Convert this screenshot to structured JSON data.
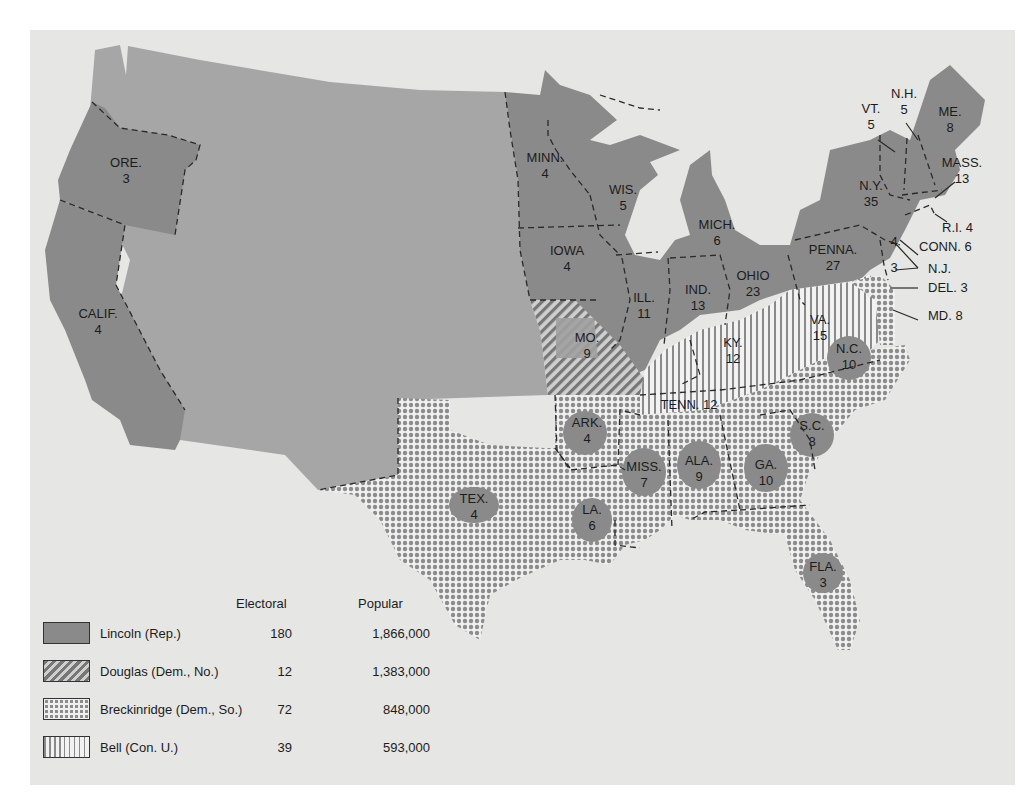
{
  "map": {
    "title": "Election of 1860",
    "background_color": "#e6e6e4",
    "colors": {
      "lincoln": "#8a8a8a",
      "territory": "#a6a6a6",
      "douglas_hatch": "#777777",
      "breckinridge_dot": "#8c8c8c",
      "bell_stripe": "#8a8a8a"
    },
    "states": [
      {
        "abbr": "ORE.",
        "electoral": "3",
        "party": "lincoln"
      },
      {
        "abbr": "CALIF.",
        "electoral": "4",
        "party": "lincoln"
      },
      {
        "abbr": "MINN.",
        "electoral": "4",
        "party": "lincoln"
      },
      {
        "abbr": "WIS.",
        "electoral": "5",
        "party": "lincoln"
      },
      {
        "abbr": "IOWA",
        "electoral": "4",
        "party": "lincoln"
      },
      {
        "abbr": "MICH.",
        "electoral": "6",
        "party": "lincoln"
      },
      {
        "abbr": "ILL.",
        "electoral": "11",
        "party": "lincoln"
      },
      {
        "abbr": "IND.",
        "electoral": "13",
        "party": "lincoln"
      },
      {
        "abbr": "OHIO",
        "electoral": "23",
        "party": "lincoln"
      },
      {
        "abbr": "PENNA.",
        "electoral": "27",
        "party": "lincoln"
      },
      {
        "abbr": "N.Y.",
        "electoral": "35",
        "party": "lincoln"
      },
      {
        "abbr": "VT.",
        "electoral": "5",
        "party": "lincoln"
      },
      {
        "abbr": "N.H.",
        "electoral": "5",
        "party": "lincoln"
      },
      {
        "abbr": "ME.",
        "electoral": "8",
        "party": "lincoln"
      },
      {
        "abbr": "MASS.",
        "electoral": "13",
        "party": "lincoln"
      },
      {
        "abbr": "R.I.",
        "electoral": "4",
        "party": "lincoln"
      },
      {
        "abbr": "CONN.",
        "electoral": "6",
        "party": "lincoln"
      },
      {
        "abbr": "N.J.",
        "electoral_lincoln": "4",
        "electoral_douglas": "3",
        "party": "split"
      },
      {
        "abbr": "MO.",
        "electoral": "9",
        "party": "douglas"
      },
      {
        "abbr": "KY.",
        "electoral": "12",
        "party": "bell"
      },
      {
        "abbr": "VA.",
        "electoral": "15",
        "party": "bell"
      },
      {
        "abbr": "TENN.",
        "electoral": "12",
        "party": "bell"
      },
      {
        "abbr": "DEL.",
        "electoral": "3",
        "party": "breckinridge"
      },
      {
        "abbr": "MD.",
        "electoral": "8",
        "party": "breckinridge"
      },
      {
        "abbr": "N.C.",
        "electoral": "10",
        "party": "breckinridge"
      },
      {
        "abbr": "S.C.",
        "electoral": "8",
        "party": "breckinridge"
      },
      {
        "abbr": "ARK.",
        "electoral": "4",
        "party": "breckinridge"
      },
      {
        "abbr": "MISS.",
        "electoral": "7",
        "party": "breckinridge"
      },
      {
        "abbr": "ALA.",
        "electoral": "9",
        "party": "breckinridge"
      },
      {
        "abbr": "GA.",
        "electoral": "10",
        "party": "breckinridge"
      },
      {
        "abbr": "LA.",
        "electoral": "6",
        "party": "breckinridge"
      },
      {
        "abbr": "TEX.",
        "electoral": "4",
        "party": "breckinridge"
      },
      {
        "abbr": "FLA.",
        "electoral": "3",
        "party": "breckinridge"
      }
    ],
    "labels": {
      "ore": "ORE.",
      "ore_n": "3",
      "calif": "CALIF.",
      "calif_n": "4",
      "minn": "MINN.",
      "minn_n": "4",
      "wis": "WIS.",
      "wis_n": "5",
      "iowa": "IOWA",
      "iowa_n": "4",
      "mich": "MICH.",
      "mich_n": "6",
      "ill": "ILL.",
      "ill_n": "11",
      "ind": "IND.",
      "ind_n": "13",
      "ohio": "OHIO",
      "ohio_n": "23",
      "penna": "PENNA.",
      "penna_n": "27",
      "ny": "N.Y.",
      "ny_n": "35",
      "vt": "VT.",
      "vt_n": "5",
      "nh": "N.H.",
      "nh_n": "5",
      "me": "ME.",
      "me_n": "8",
      "mass": "MASS.",
      "mass_n": "13",
      "ri": "R.I. 4",
      "conn": "CONN. 6",
      "nj": "N.J.",
      "nj_a": "4",
      "nj_b": "3",
      "del": "DEL. 3",
      "md": "MD. 8",
      "mo": "MO.",
      "mo_n": "9",
      "ky": "KY.",
      "ky_n": "12",
      "va": "VA.",
      "va_n": "15",
      "tenn": "TENN. 12",
      "nc": "N.C.",
      "nc_n": "10",
      "sc": "S.C.",
      "sc_n": "8",
      "ark": "ARK.",
      "ark_n": "4",
      "miss": "MISS.",
      "miss_n": "7",
      "ala": "ALA.",
      "ala_n": "9",
      "ga": "GA.",
      "ga_n": "10",
      "la": "LA.",
      "la_n": "6",
      "tex": "TEX.",
      "tex_n": "4",
      "fla": "FLA.",
      "fla_n": "3"
    }
  },
  "legend": {
    "headers": {
      "electoral": "Electoral",
      "popular": "Popular"
    },
    "entries": [
      {
        "name": "Lincoln (Rep.)",
        "electoral": "180",
        "popular": "1,866,000",
        "pattern": "solid"
      },
      {
        "name": "Douglas (Dem., No.)",
        "electoral": "12",
        "popular": "1,383,000",
        "pattern": "diagonal-hatch"
      },
      {
        "name": "Breckinridge (Dem., So.)",
        "electoral": "72",
        "popular": "848,000",
        "pattern": "dots"
      },
      {
        "name": "Bell (Con. U.)",
        "electoral": "39",
        "popular": "593,000",
        "pattern": "vertical-stripes"
      }
    ]
  }
}
